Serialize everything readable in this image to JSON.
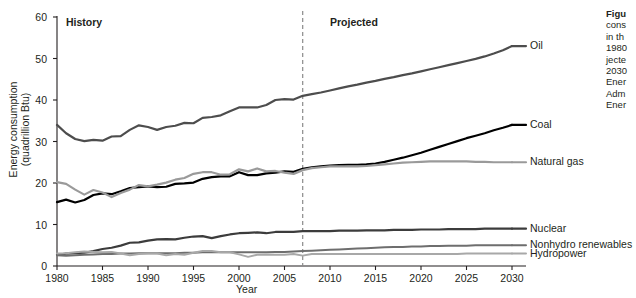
{
  "chart_data": {
    "type": "line",
    "title": "",
    "xlabel": "Year",
    "ylabel": "Energy consumption (quadrillion Btu)",
    "ylabel_line1": "Energy consumption",
    "ylabel_line2": "(quadrillion Btu)",
    "xlim": [
      1980,
      2030
    ],
    "ylim": [
      0,
      60
    ],
    "xticks": [
      1980,
      1985,
      1990,
      1995,
      2000,
      2005,
      2010,
      2015,
      2020,
      2025,
      2030
    ],
    "yticks": [
      0,
      10,
      20,
      30,
      40,
      50,
      60
    ],
    "grid": false,
    "legend_position": "right-inline",
    "annotations": [
      {
        "name": "history",
        "label": "History",
        "x": 1981.5,
        "y": 57
      },
      {
        "name": "projected",
        "label": "Projected",
        "x": 2008.5,
        "y": 57
      }
    ],
    "divider": {
      "x": 2007,
      "style": "dashed",
      "color": "#8b8b8b"
    },
    "x": [
      1980,
      1981,
      1982,
      1983,
      1984,
      1985,
      1986,
      1987,
      1988,
      1989,
      1990,
      1991,
      1992,
      1993,
      1994,
      1995,
      1996,
      1997,
      1998,
      1999,
      2000,
      2001,
      2002,
      2003,
      2004,
      2005,
      2006,
      2007,
      2008,
      2009,
      2010,
      2011,
      2012,
      2013,
      2014,
      2015,
      2016,
      2017,
      2018,
      2019,
      2020,
      2021,
      2022,
      2023,
      2024,
      2025,
      2026,
      2027,
      2028,
      2029,
      2030
    ],
    "series": [
      {
        "name": "Oil",
        "label": "Oil",
        "color": "#4d4d4d",
        "width": 2.2,
        "end_value": 53,
        "values": [
          34.0,
          32.0,
          30.6,
          30.1,
          30.4,
          30.2,
          31.2,
          31.3,
          32.8,
          33.9,
          33.5,
          32.8,
          33.5,
          33.8,
          34.5,
          34.4,
          35.7,
          35.9,
          36.3,
          37.3,
          38.2,
          38.2,
          38.2,
          38.8,
          40.0,
          40.2,
          40.1,
          41.0,
          41.4,
          41.8,
          42.3,
          42.8,
          43.3,
          43.7,
          44.2,
          44.6,
          45.1,
          45.5,
          46.0,
          46.4,
          46.9,
          47.4,
          47.9,
          48.4,
          48.9,
          49.4,
          49.9,
          50.5,
          51.2,
          52.0,
          53.0
        ]
      },
      {
        "name": "Coal",
        "label": "Coal",
        "color": "#000000",
        "width": 2.2,
        "end_value": 34,
        "values": [
          15.4,
          16.0,
          15.3,
          15.9,
          17.1,
          17.5,
          17.3,
          18.0,
          18.8,
          19.0,
          19.2,
          19.0,
          19.1,
          19.8,
          19.9,
          20.1,
          21.0,
          21.4,
          21.6,
          21.6,
          22.6,
          21.9,
          21.9,
          22.3,
          22.5,
          22.8,
          22.7,
          23.4,
          23.8,
          24.0,
          24.2,
          24.3,
          24.4,
          24.4,
          24.5,
          24.7,
          25.1,
          25.6,
          26.1,
          26.7,
          27.3,
          28.0,
          28.7,
          29.4,
          30.1,
          30.8,
          31.4,
          32.0,
          32.7,
          33.3,
          34.0
        ]
      },
      {
        "name": "Natural gas",
        "label": "Natural gas",
        "color": "#9a9a9a",
        "width": 2.2,
        "end_value": 25,
        "values": [
          20.2,
          19.8,
          18.4,
          17.2,
          18.3,
          17.7,
          16.6,
          17.6,
          18.4,
          19.5,
          19.2,
          19.6,
          20.1,
          20.8,
          21.2,
          22.2,
          22.6,
          22.6,
          22.0,
          22.1,
          23.3,
          22.8,
          23.5,
          22.8,
          22.9,
          22.5,
          22.2,
          23.1,
          23.6,
          23.8,
          24.0,
          24.0,
          24.0,
          24.0,
          24.1,
          24.3,
          24.5,
          24.7,
          24.9,
          25.0,
          25.1,
          25.2,
          25.2,
          25.2,
          25.2,
          25.2,
          25.1,
          25.1,
          25.0,
          25.0,
          25.0
        ]
      },
      {
        "name": "Nuclear",
        "label": "Nuclear",
        "color": "#3c3c3c",
        "width": 2.2,
        "end_value": 9,
        "values": [
          2.7,
          3.0,
          3.1,
          3.2,
          3.6,
          4.1,
          4.4,
          4.9,
          5.6,
          5.7,
          6.1,
          6.4,
          6.5,
          6.4,
          6.8,
          7.1,
          7.2,
          6.7,
          7.2,
          7.6,
          7.9,
          8.0,
          8.1,
          7.9,
          8.2,
          8.2,
          8.2,
          8.4,
          8.4,
          8.4,
          8.4,
          8.5,
          8.5,
          8.5,
          8.6,
          8.6,
          8.6,
          8.7,
          8.7,
          8.7,
          8.8,
          8.8,
          8.8,
          8.9,
          8.9,
          8.9,
          8.9,
          9.0,
          9.0,
          9.0,
          9.0
        ]
      },
      {
        "name": "Nonhydro renewables",
        "label": "Nonhydro renewables",
        "color": "#6e6e6e",
        "width": 2.0,
        "end_value": 5,
        "values": [
          2.6,
          2.5,
          2.6,
          2.7,
          2.8,
          2.9,
          2.9,
          3.0,
          3.0,
          3.1,
          3.1,
          3.1,
          3.1,
          3.1,
          3.2,
          3.2,
          3.3,
          3.3,
          3.3,
          3.3,
          3.3,
          3.3,
          3.3,
          3.3,
          3.4,
          3.4,
          3.5,
          3.6,
          3.7,
          3.8,
          3.9,
          4.0,
          4.1,
          4.2,
          4.3,
          4.4,
          4.5,
          4.6,
          4.6,
          4.7,
          4.7,
          4.8,
          4.8,
          4.9,
          4.9,
          4.9,
          5.0,
          5.0,
          5.0,
          5.0,
          5.0
        ]
      },
      {
        "name": "Hydropower",
        "label": "Hydropower",
        "color": "#a8a8a8",
        "width": 2.0,
        "end_value": 3,
        "values": [
          3.0,
          3.1,
          3.3,
          3.5,
          3.4,
          3.3,
          3.4,
          3.0,
          2.6,
          2.9,
          3.0,
          3.0,
          2.6,
          2.9,
          2.7,
          3.2,
          3.6,
          3.6,
          3.3,
          3.3,
          2.8,
          2.2,
          2.7,
          2.8,
          2.7,
          2.7,
          2.9,
          2.5,
          2.9,
          2.9,
          2.9,
          2.9,
          2.9,
          2.9,
          2.9,
          2.9,
          2.9,
          2.9,
          2.9,
          2.9,
          2.9,
          2.9,
          2.9,
          2.9,
          2.9,
          3.0,
          3.0,
          3.0,
          3.0,
          3.0,
          3.0
        ]
      }
    ]
  },
  "caption": {
    "bold_lead": "Figu",
    "lines": [
      "cons",
      "in th",
      "1980",
      "jecte",
      "2030",
      "Ener",
      "Adm",
      "Ener"
    ]
  }
}
